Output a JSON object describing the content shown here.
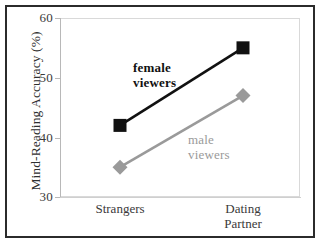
{
  "chart_data": {
    "type": "line",
    "title": "",
    "xlabel": "",
    "ylabel": "Mind-Reading Accuracy (%)",
    "categories": [
      "Strangers",
      "Dating Partner"
    ],
    "category_lines": [
      [
        "Strangers"
      ],
      [
        "Dating",
        "Partner"
      ]
    ],
    "ylim": [
      30,
      60
    ],
    "yticks": [
      30,
      40,
      50,
      60
    ],
    "ytick_labels": [
      "30",
      "40",
      "50",
      "60"
    ],
    "grid": false,
    "legend_position": "inline-annotations",
    "series": [
      {
        "name": "female viewers",
        "values": [
          42,
          55
        ],
        "color": "#111111",
        "marker": "square",
        "label_lines": [
          "female",
          "viewers"
        ],
        "label_bold": true
      },
      {
        "name": "male viewers",
        "values": [
          35,
          47
        ],
        "color": "#9a9a9a",
        "marker": "diamond",
        "label_lines": [
          "male",
          "viewers"
        ],
        "label_bold": false
      }
    ],
    "annotations": [
      {
        "text": "female viewers",
        "color": "#111111"
      },
      {
        "text": "male viewers",
        "color": "#9a9a9a"
      }
    ]
  },
  "axis": {
    "y_title": "Mind-Reading Accuracy (%)",
    "y_tick_60": "60",
    "y_tick_50": "50",
    "y_tick_40": "40",
    "y_tick_30": "30",
    "x_tick_0": "Strangers",
    "x_tick_1_line1": "Dating",
    "x_tick_1_line2": "Partner"
  },
  "annotations": {
    "female_line1": "female",
    "female_line2": "viewers",
    "male_line1": "male",
    "male_line2": "viewers"
  },
  "colors": {
    "female_series": "#111111",
    "male_series": "#9a9a9a",
    "frame": "#2b2b2b",
    "axis": "#b8b8b8",
    "background": "#ffffff"
  }
}
